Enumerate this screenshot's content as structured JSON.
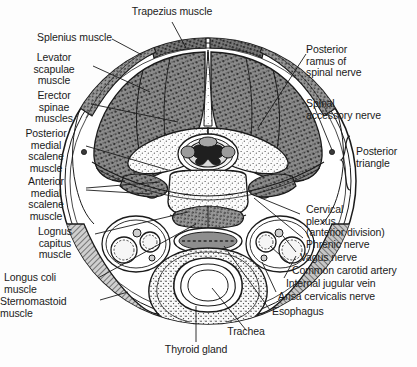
{
  "figure": {
    "ink_color": "#1b1b1b",
    "paper_color": "#fdfdfd",
    "muscle_fill": "#6f6f6f",
    "bone_fill": "#e8e8e8",
    "artist_signature": "Palmer"
  },
  "labels": {
    "trapezius": "Trapezius muscle",
    "splenius": "Splenius muscle",
    "levator_scapulae": "Levator\nscapulae\nmuscle",
    "erector_spinae": "Erector\nspinae\nmuscles",
    "posterior_medial_scalene": "Posterior\nmedial\nscalene\nmuscle",
    "anterior_medial_scalene": "Anterior\nmedial\nscalene\nmuscle",
    "longus_capitis": "Lognus\ncapitus\nmuscle",
    "longus_colli": "Longus coli\nmuscle",
    "sternomastoid": "Sternomastoid\nmuscle",
    "posterior_ramus": "Posterior\nramus of\nspinal nerve",
    "spinal_accessory": "Spinal\naccessory nerve",
    "posterior_triangle": "Posterior\ntriangle",
    "cervical_plexus": "Cervical\nplexus\n(anterior division)",
    "phrenic_nerve": "Phrenic nerve",
    "vagus_nerve": "Vagus nerve",
    "common_carotid": "Common carotid artery",
    "internal_jugular": "Internal jugular vein",
    "ansa_cervicalis": "Ansa cervicalis nerve",
    "esophagus": "Esophagus",
    "trachea": "Trachea",
    "thyroid_gland": "Thyroid gland"
  }
}
